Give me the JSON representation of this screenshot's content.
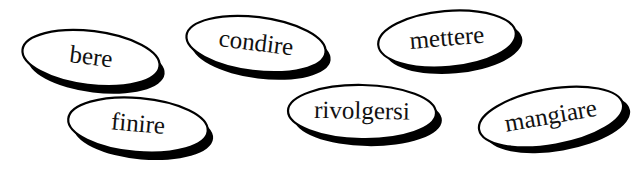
{
  "canvas": {
    "width": 629,
    "height": 163,
    "background_color": "#ffffff"
  },
  "style": {
    "outline_color": "#000000",
    "shadow_color": "#000000",
    "fill_color": "#ffffff",
    "text_color": "#111111"
  },
  "bubbles": [
    {
      "label": "bere",
      "cx": 91,
      "cy": 58,
      "rx": 69,
      "ry": 27,
      "rotation": 7,
      "font_size": 25,
      "stroke_width": 2.2,
      "shadow_dx": 6,
      "shadow_dy": 7
    },
    {
      "label": "condire",
      "cx": 256,
      "cy": 44,
      "rx": 70,
      "ry": 27,
      "rotation": 7,
      "font_size": 25,
      "stroke_width": 2.2,
      "shadow_dx": 6,
      "shadow_dy": 7
    },
    {
      "label": "mettere",
      "cx": 447,
      "cy": 39,
      "rx": 69,
      "ry": 28,
      "rotation": -5,
      "font_size": 25,
      "stroke_width": 2.2,
      "shadow_dx": 6,
      "shadow_dy": 7
    },
    {
      "label": "finire",
      "cx": 138,
      "cy": 125,
      "rx": 70,
      "ry": 27,
      "rotation": 5,
      "font_size": 25,
      "stroke_width": 2.2,
      "shadow_dx": 6,
      "shadow_dy": 7
    },
    {
      "label": "rivolgersi",
      "cx": 362,
      "cy": 112,
      "rx": 74,
      "ry": 27,
      "rotation": 1,
      "font_size": 25,
      "stroke_width": 2.2,
      "shadow_dx": 6,
      "shadow_dy": 7
    },
    {
      "label": "mangiare",
      "cx": 551,
      "cy": 117,
      "rx": 73,
      "ry": 28,
      "rotation": -10,
      "font_size": 25,
      "stroke_width": 2.2,
      "shadow_dx": 6,
      "shadow_dy": 7
    }
  ]
}
